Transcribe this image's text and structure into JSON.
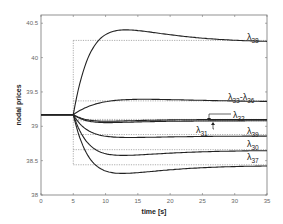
{
  "chart_data": {
    "type": "line",
    "title": "",
    "xlabel": "time [s]",
    "ylabel": "nodal prices",
    "xlim": [
      0,
      35
    ],
    "ylim": [
      38,
      40.62
    ],
    "xticks": [
      0,
      5,
      10,
      15,
      20,
      25,
      30,
      35
    ],
    "yticks": [
      38,
      38.5,
      39,
      39.5,
      40,
      40.5
    ],
    "ytick_labels": [
      "38",
      "38.5",
      "39",
      "39.5",
      "40",
      "40.5"
    ],
    "grid": false,
    "legend": "inline labels at right",
    "initial_value": 39.17,
    "step_time": 5,
    "series": [
      {
        "name": "λ38",
        "label_main": "λ",
        "label_sub": "38",
        "final": 40.22,
        "peak": 40.44,
        "peak_t": 10.7,
        "reference": 40.25
      },
      {
        "name": "λ33-λ36",
        "label_main": "λ",
        "label_sub": "33",
        "label_main2": "-λ",
        "label_sub2": "36",
        "final": 39.35,
        "peak": 39.4,
        "peak_t": 13,
        "reference": 39.37
      },
      {
        "name": "λ32",
        "label_main": "λ",
        "label_sub": "32",
        "final": 39.1,
        "peak": 39.07,
        "peak_t": 9,
        "reference": 39.1
      },
      {
        "name": "λ31",
        "label_main": "λ",
        "label_sub": "31",
        "final": 39.08,
        "peak": 39.05,
        "peak_t": 9,
        "reference": 39.08
      },
      {
        "name": "λ39",
        "label_main": "λ",
        "label_sub": "39",
        "final": 38.86,
        "peak": 38.83,
        "peak_t": 10.5,
        "reference": 38.88
      },
      {
        "name": "λ30",
        "label_main": "λ",
        "label_sub": "30",
        "final": 38.65,
        "peak": 38.56,
        "peak_t": 10.3,
        "reference": 38.66
      },
      {
        "name": "λ37",
        "label_main": "λ",
        "label_sub": "37",
        "final": 38.43,
        "peak": 38.29,
        "peak_t": 10.3,
        "reference": 38.44
      }
    ]
  },
  "labels": {
    "xlabel": "time [s]",
    "ylabel": "nodal prices"
  }
}
